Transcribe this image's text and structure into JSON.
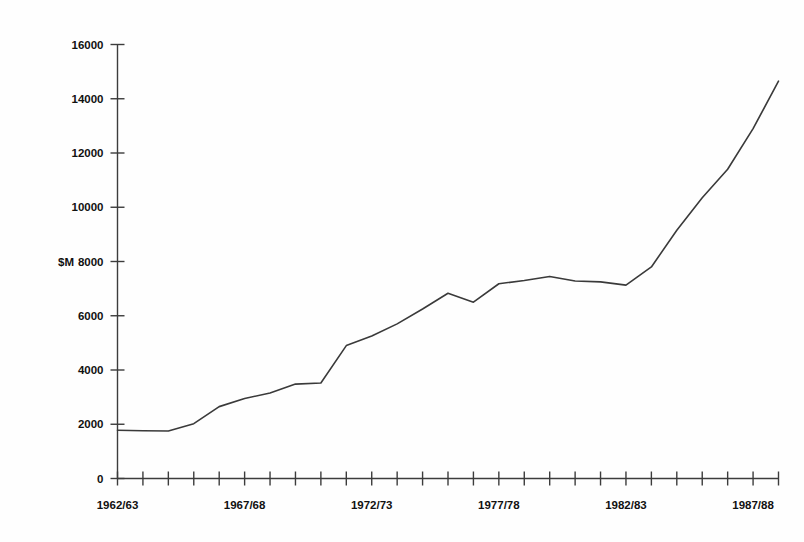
{
  "chart_data": {
    "type": "line",
    "title": "",
    "subtitle": "",
    "xlabel": "",
    "ylabel": "$M",
    "ylim": [
      0,
      16000
    ],
    "xlim_labels": [
      "1962/63",
      "1988/89"
    ],
    "grid": false,
    "legend": null,
    "y_ticks": [
      0,
      2000,
      4000,
      6000,
      8000,
      10000,
      12000,
      14000,
      16000
    ],
    "y_tick_labels": [
      "0",
      "2000",
      "4000",
      "6000",
      "8000",
      "10000",
      "12000",
      "14000",
      "16000"
    ],
    "x_tick_labels_shown": [
      "1962/63",
      "1967/68",
      "1972/73",
      "1977/78",
      "1982/83",
      "1987/88"
    ],
    "x_tick_label_indices": [
      0,
      5,
      10,
      15,
      20,
      25
    ],
    "x_tick_count": 27,
    "categories": [
      "1962/63",
      "1963/64",
      "1964/65",
      "1965/66",
      "1966/67",
      "1967/68",
      "1968/69",
      "1969/70",
      "1970/71",
      "1971/72",
      "1972/73",
      "1973/74",
      "1974/75",
      "1975/76",
      "1976/77",
      "1977/78",
      "1978/79",
      "1979/80",
      "1980/81",
      "1981/82",
      "1982/83",
      "1983/84",
      "1984/85",
      "1985/86",
      "1986/87",
      "1987/88",
      "1988/89"
    ],
    "series": [
      {
        "name": "Value",
        "color": "#3a3a3a",
        "values": [
          1780,
          1760,
          1750,
          2020,
          2650,
          2950,
          3150,
          3480,
          3520,
          4900,
          5250,
          5700,
          6250,
          6830,
          6500,
          7180,
          7300,
          7450,
          7280,
          7250,
          7130,
          7800,
          9150,
          10350,
          11400,
          12900,
          14650
        ]
      }
    ],
    "annotations": []
  },
  "axis": {
    "y_unit_label": "$M"
  }
}
